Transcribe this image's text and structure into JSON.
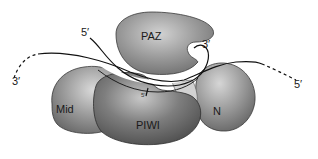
{
  "figure": {
    "domains": [
      {
        "id": "paz",
        "label": "PAZ",
        "color": "#8e8e8e"
      },
      {
        "id": "mid",
        "label": "Mid",
        "color": "#8a8a8a"
      },
      {
        "id": "piwi",
        "label": "PIWI",
        "color": "#6e6e6e"
      },
      {
        "id": "n",
        "label": "N",
        "color": "#8c8c8c"
      }
    ],
    "strand_labels": {
      "guide_5prime_top": "5′",
      "guide_3prime_paz": "3′",
      "target_3prime_left": "3′",
      "target_5prime_right": "5′",
      "guide_5prime_pocket": "5′"
    },
    "colors": {
      "background": "#ffffff",
      "strand": "#111111",
      "channel_fill": "#ffffff",
      "cleft_fill": "#cfcfcf"
    }
  }
}
